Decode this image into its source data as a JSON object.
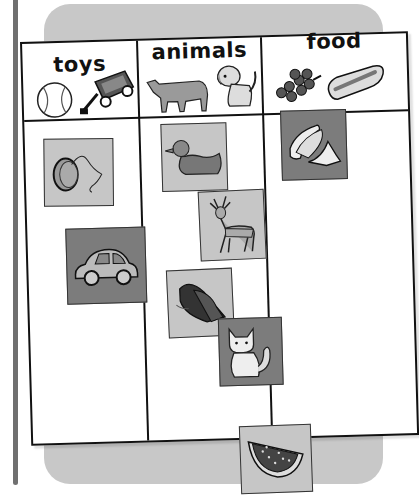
{
  "worksheet": {
    "columns": [
      {
        "label": "toys",
        "header_icons": [
          "baseball-icon",
          "wagon-icon"
        ],
        "items": [
          "yo-yo-icon",
          "car-icon"
        ]
      },
      {
        "label": "animals",
        "header_icons": [
          "cow-icon",
          "dog-icon"
        ],
        "items": [
          "duck-icon",
          "deer-icon",
          "butterfly-icon",
          "cat-icon"
        ]
      },
      {
        "label": "food",
        "header_icons": [
          "grapes-icon",
          "hot-dog-icon"
        ],
        "items": [
          "bananas-icon"
        ]
      }
    ],
    "loose_card": "watermelon-icon"
  },
  "colors": {
    "panel": "#c8c8c8",
    "card_light": "#c6c6c6",
    "card_dark": "#7c7c7c",
    "spine": "#707070",
    "line": "#111111"
  }
}
